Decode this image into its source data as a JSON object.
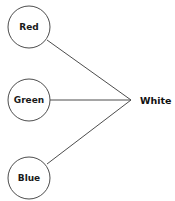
{
  "diagram": {
    "type": "node-link-convergence",
    "background_color": "#ffffff",
    "stroke_color": "#4d4d4d",
    "text_color": "#1a1a1a",
    "inputs": [
      {
        "id": "red",
        "label": "Red",
        "shape": "circle",
        "cx": 29,
        "cy": 27,
        "r": 21
      },
      {
        "id": "green",
        "label": "Green",
        "shape": "circle",
        "cx": 29,
        "cy": 100,
        "r": 21
      },
      {
        "id": "blue",
        "label": "Blue",
        "shape": "circle",
        "cx": 29,
        "cy": 178,
        "r": 21
      }
    ],
    "output": {
      "id": "white",
      "label": "White",
      "x": 140,
      "y": 100
    },
    "convergence_point": {
      "x": 131,
      "y": 100
    },
    "edges": [
      {
        "id": "red-to-white",
        "from": "red",
        "to": "white",
        "x1": 47,
        "y1": 40,
        "x2": 131,
        "y2": 100
      },
      {
        "id": "green-to-white",
        "from": "green",
        "to": "white",
        "x1": 50,
        "y1": 100,
        "x2": 131,
        "y2": 100
      },
      {
        "id": "blue-to-white",
        "from": "blue",
        "to": "white",
        "x1": 47,
        "y1": 164,
        "x2": 131,
        "y2": 100
      }
    ]
  }
}
